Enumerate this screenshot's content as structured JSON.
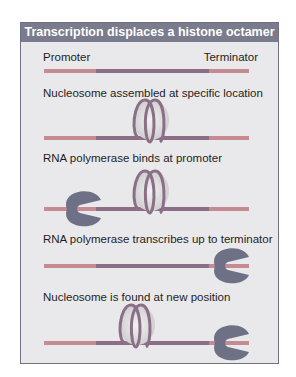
{
  "title": "Transcription displaces a histone octamer",
  "labels": {
    "promoter": "Promoter",
    "terminator": "Terminator"
  },
  "steps": [
    {
      "caption": "Nucleosome assembled at specific location"
    },
    {
      "caption": "RNA polymerase binds at promoter"
    },
    {
      "caption": "RNA polymerase transcribes up to terminator"
    },
    {
      "caption": "Nucleosome is found at new position"
    }
  ],
  "colors": {
    "header": "#7a7b8c",
    "panel": "#e9e9eb",
    "dna_flank": "#c58a92",
    "dna_gene": "#8a6f86",
    "polymerase": "#6e7086",
    "histone": "#d6d6d8"
  }
}
